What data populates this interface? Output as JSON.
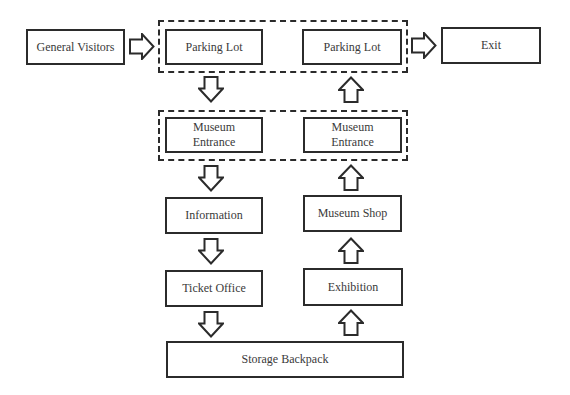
{
  "diagram": {
    "title": "",
    "nodes": [
      {
        "id": "general_visitors",
        "label": "General Visitors"
      },
      {
        "id": "parking_lot_in",
        "label": "Parking Lot"
      },
      {
        "id": "parking_lot_out",
        "label": "Parking Lot"
      },
      {
        "id": "exit",
        "label": "Exit"
      },
      {
        "id": "museum_entrance_in",
        "label": "Museum Entrance",
        "lines": [
          "Museum",
          "Entrance"
        ]
      },
      {
        "id": "museum_entrance_out",
        "label": "Museum Entrance",
        "lines": [
          "Museum",
          "Entrance"
        ]
      },
      {
        "id": "information",
        "label": "Information"
      },
      {
        "id": "museum_shop",
        "label": "Museum Shop"
      },
      {
        "id": "ticket_office",
        "label": "Ticket Office"
      },
      {
        "id": "exhibition",
        "label": "Exhibition"
      },
      {
        "id": "storage_backpack",
        "label": "Storage Backpack"
      }
    ],
    "groups": [
      {
        "id": "parking_group",
        "members": [
          "parking_lot_in",
          "parking_lot_out"
        ],
        "style": "dashed"
      },
      {
        "id": "entrance_group",
        "members": [
          "museum_entrance_in",
          "museum_entrance_out"
        ],
        "style": "dashed"
      }
    ],
    "edges": [
      {
        "from": "general_visitors",
        "to": "parking_lot_in",
        "direction": "right"
      },
      {
        "from": "parking_lot_in",
        "to": "museum_entrance_in",
        "direction": "down"
      },
      {
        "from": "museum_entrance_in",
        "to": "information",
        "direction": "down"
      },
      {
        "from": "information",
        "to": "ticket_office",
        "direction": "down"
      },
      {
        "from": "ticket_office",
        "to": "storage_backpack",
        "direction": "down"
      },
      {
        "from": "storage_backpack",
        "to": "exhibition",
        "direction": "up"
      },
      {
        "from": "exhibition",
        "to": "museum_shop",
        "direction": "up"
      },
      {
        "from": "museum_shop",
        "to": "museum_entrance_out",
        "direction": "up"
      },
      {
        "from": "museum_entrance_out",
        "to": "parking_lot_out",
        "direction": "up"
      },
      {
        "from": "parking_lot_out",
        "to": "exit",
        "direction": "right"
      }
    ]
  },
  "labels": {
    "general_visitors": "General Visitors",
    "parking_lot_in": "Parking Lot",
    "parking_lot_out": "Parking Lot",
    "exit": "Exit",
    "museum_entrance_in_1": "Museum",
    "museum_entrance_in_2": "Entrance",
    "museum_entrance_out_1": "Museum",
    "museum_entrance_out_2": "Entrance",
    "information": "Information",
    "museum_shop": "Museum Shop",
    "ticket_office": "Ticket Office",
    "exhibition": "Exhibition",
    "storage_backpack": "Storage Backpack"
  },
  "colors": {
    "stroke": "#2b2b2b",
    "text": "#3a3a3a",
    "background": "#ffffff"
  }
}
